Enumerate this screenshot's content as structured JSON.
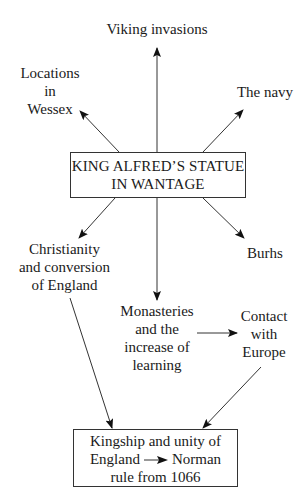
{
  "diagram": {
    "center_node": {
      "lines": [
        "KING ALFRED’S STATUE",
        "IN WANTAGE"
      ]
    },
    "nodes": {
      "viking_invasions": {
        "lines": [
          "Viking invasions"
        ]
      },
      "locations_in_wessex": {
        "lines": [
          "Locations",
          "in",
          "Wessex"
        ]
      },
      "the_navy": {
        "lines": [
          "The navy"
        ]
      },
      "christianity": {
        "lines": [
          "Christianity",
          "and conversion",
          "of England"
        ]
      },
      "burhs": {
        "lines": [
          "Burhs"
        ]
      },
      "monasteries": {
        "lines": [
          "Monasteries",
          "and the",
          "increase of",
          "learning"
        ]
      },
      "contact_europe": {
        "lines": [
          "Contact",
          "with",
          "Europe"
        ]
      }
    },
    "outcome_node": {
      "line1": "Kingship and unity of",
      "line2_left": "England",
      "line2_right": "Norman",
      "line3": "rule from 1066"
    },
    "edges": [
      {
        "from": "center",
        "to": "viking_invasions"
      },
      {
        "from": "center",
        "to": "locations_in_wessex"
      },
      {
        "from": "center",
        "to": "the_navy"
      },
      {
        "from": "center",
        "to": "christianity"
      },
      {
        "from": "center",
        "to": "burhs"
      },
      {
        "from": "center",
        "to": "monasteries"
      },
      {
        "from": "monasteries",
        "to": "contact_europe"
      },
      {
        "from": "christianity",
        "to": "outcome"
      },
      {
        "from": "contact_europe",
        "to": "outcome"
      }
    ],
    "colors": {
      "line": "#333333",
      "text": "#1a1a1a",
      "background": "#ffffff"
    }
  }
}
